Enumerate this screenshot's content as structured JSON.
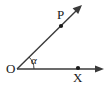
{
  "figure": {
    "type": "geometry-angle-diagram",
    "background_color": "#ffffff",
    "stroke_color": "#333333",
    "label_color": "#1a1a1a"
  },
  "labels": {
    "vertex": "O",
    "ray_point": "P",
    "axis_point": "X",
    "angle": "α"
  },
  "geometry": {
    "origin": {
      "x": 17,
      "y": 69
    },
    "ray_p_end": {
      "x": 80,
      "y": 7
    },
    "ray_x_end": {
      "x": 100,
      "y": 69
    },
    "point_p_dot": {
      "x": 61,
      "y": 26
    },
    "point_x_dot": {
      "x": 78,
      "y": 68
    },
    "arc_radius": 17,
    "angle_degrees": 45
  }
}
